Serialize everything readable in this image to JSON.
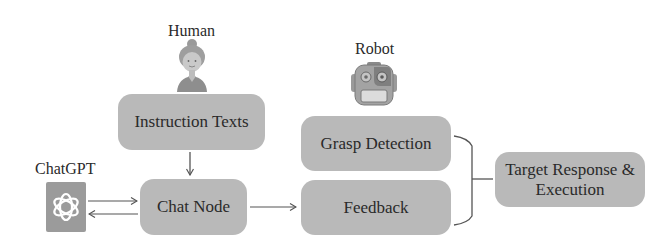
{
  "diagram": {
    "actors": {
      "human": {
        "label": "Human",
        "icon": "person-icon"
      },
      "robot": {
        "label": "Robot",
        "icon": "robot-icon"
      },
      "chatgpt": {
        "label": "ChatGPT",
        "icon": "openai-logo-icon"
      }
    },
    "nodes": {
      "instruction": {
        "label": "Instruction Texts"
      },
      "chat_node": {
        "label": "Chat Node"
      },
      "grasp": {
        "label": "Grasp Detection"
      },
      "feedback": {
        "label": "Feedback"
      },
      "target": {
        "label_line1": "Target Response &",
        "label_line2": "Execution"
      }
    },
    "edges": [
      {
        "from": "Instruction Texts",
        "to": "Chat Node",
        "type": "arrow"
      },
      {
        "from": "ChatGPT",
        "to": "Chat Node",
        "type": "arrow"
      },
      {
        "from": "Chat Node",
        "to": "ChatGPT",
        "type": "arrow"
      },
      {
        "from": "Chat Node",
        "to": "Feedback",
        "type": "arrow"
      },
      {
        "from": [
          "Grasp Detection",
          "Feedback"
        ],
        "to": "Target Response & Execution",
        "type": "brace"
      }
    ],
    "colors": {
      "box_fill": "#b9b9b9",
      "line": "#555555",
      "text": "#2a2a2a"
    }
  }
}
